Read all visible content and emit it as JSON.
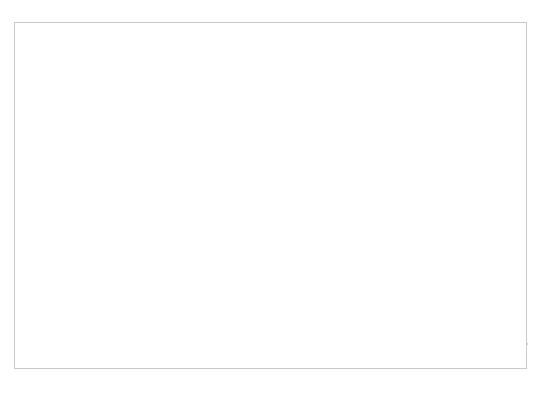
{
  "chart_data": {
    "type": "line",
    "title": "",
    "xlabel": "Year",
    "ylabel": "SO2 Concentration [ppmv]",
    "ylabel_main": "SO",
    "ylabel_sub": "2",
    "ylabel_rest": " Concentration [ppm",
    "ylabel_rest_sub": "v",
    "ylabel_close": "]",
    "xlim": [
      1980,
      2015
    ],
    "ylim": [
      0,
      0.035
    ],
    "xticks": [
      1980,
      1985,
      1990,
      1995,
      2000,
      2005,
      2010,
      2015
    ],
    "xticklabels": [
      "1980",
      "1985",
      "1990",
      "1995",
      "2000",
      "2005",
      "2010",
      "2015"
    ],
    "yticks": [
      0,
      0.005,
      0.01,
      0.015,
      0.02,
      0.025,
      0.03,
      0.035
    ],
    "yticklabels": [
      "0",
      "0.005",
      "0.01",
      "0.015",
      "0.02",
      "0.025",
      "0.03",
      "0.035"
    ],
    "grid": true,
    "grid_axis": "y",
    "legend_position": "upper right",
    "x": [
      1980,
      1981,
      1982,
      1983,
      1984,
      1985,
      1986,
      1987,
      1988,
      1989,
      1990,
      1991,
      1992,
      1993,
      1994,
      1995,
      1996,
      1997,
      1998,
      1999,
      2000,
      2001,
      2002,
      2003,
      2004,
      2005,
      2006,
      2007,
      2008,
      2009,
      2010
    ],
    "series": [
      {
        "name": "Standard (Annual)",
        "color": "#333333",
        "width": 3.2,
        "values": [
          0.03,
          0.03,
          0.03,
          0.03,
          0.03,
          0.03,
          0.03,
          0.03,
          0.03,
          0.03,
          0.03,
          0.03,
          0.03,
          0.03,
          0.03,
          0.03,
          0.03,
          0.03,
          0.03,
          0.03,
          0.03,
          0.03,
          0.03,
          0.03,
          0.03,
          0.03,
          0.03,
          0.03,
          0.03,
          0.03,
          0.03
        ]
      },
      {
        "name": "90th %",
        "color": "#333333",
        "width": 2.6,
        "values": [
          0.0216,
          0.02,
          0.0183,
          0.0172,
          0.0169,
          0.0173,
          0.0165,
          0.0153,
          0.0152,
          0.015,
          0.0146,
          0.0142,
          0.0138,
          0.0139,
          0.0133,
          0.0129,
          0.0127,
          0.0122,
          0.0117,
          0.0111,
          0.0103,
          0.0098,
          0.01,
          0.0103,
          0.0097,
          0.0091,
          0.0084,
          0.0076,
          0.0067,
          0.0044,
          0.0047
        ]
      },
      {
        "name": "Average",
        "color": "#9a9a9a",
        "width": 2.6,
        "values": [
          0.0118,
          0.0113,
          0.0106,
          0.0102,
          0.0104,
          0.0101,
          0.0099,
          0.0096,
          0.0098,
          0.0096,
          0.0093,
          0.009,
          0.0088,
          0.0086,
          0.0081,
          0.008,
          0.0069,
          0.0066,
          0.0066,
          0.0063,
          0.006,
          0.0056,
          0.0055,
          0.0055,
          0.0052,
          0.005,
          0.0046,
          0.0042,
          0.0037,
          0.0029,
          0.0025
        ]
      },
      {
        "name": "10th %",
        "color": "#333333",
        "width": 2.6,
        "values": [
          0.0037,
          0.0035,
          0.0031,
          0.0029,
          0.0032,
          0.003,
          0.0025,
          0.0023,
          0.0023,
          0.0024,
          0.0024,
          0.0022,
          0.0023,
          0.0024,
          0.0024,
          0.0023,
          0.0022,
          0.0023,
          0.0024,
          0.0025,
          0.0025,
          0.0025,
          0.0024,
          0.0022,
          0.0022,
          0.0023,
          0.0021,
          0.0018,
          0.0015,
          0.0009,
          0.0006
        ]
      }
    ]
  },
  "legend": {
    "items": [
      {
        "label": "Standard (Annual)",
        "color": "#333333"
      },
      {
        "label": "90th %",
        "color": "#333333"
      },
      {
        "label": "Average",
        "color": "#9a9a9a"
      },
      {
        "label": "10th %",
        "color": "#333333"
      }
    ]
  }
}
